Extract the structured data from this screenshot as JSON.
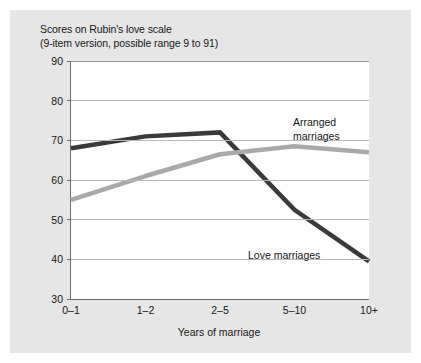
{
  "figure": {
    "title_line1": "Scores on Rubin's love scale",
    "title_line2": "(9-item version, possible range 9 to 91)",
    "background_color": "#e6e6e6",
    "plot_background_color": "#ffffff"
  },
  "chart_data": {
    "type": "line",
    "title": "Scores on Rubin's love scale (9-item version, possible range 9 to 91)",
    "xlabel": "Years of marriage",
    "ylabel": "",
    "categories": [
      "0–1",
      "1–2",
      "2–5",
      "5–10",
      "10+"
    ],
    "ylim": [
      30,
      90
    ],
    "yticks": [
      30,
      40,
      50,
      60,
      70,
      80,
      90
    ],
    "grid": "horizontal",
    "legend": "inline-annotations",
    "series": [
      {
        "name": "Arranged marriages",
        "color": "#3a3a3a",
        "values": [
          68,
          71,
          72,
          52.5,
          39.5
        ]
      },
      {
        "name": "Love marriages",
        "color": "#a9a9a9",
        "values": [
          55,
          61,
          66.5,
          68.5,
          67
        ]
      }
    ],
    "annotations": [
      {
        "text_line1": "Arranged",
        "text_line2": "marriages"
      },
      {
        "text_line1": "Love marriages",
        "text_line2": ""
      }
    ]
  }
}
